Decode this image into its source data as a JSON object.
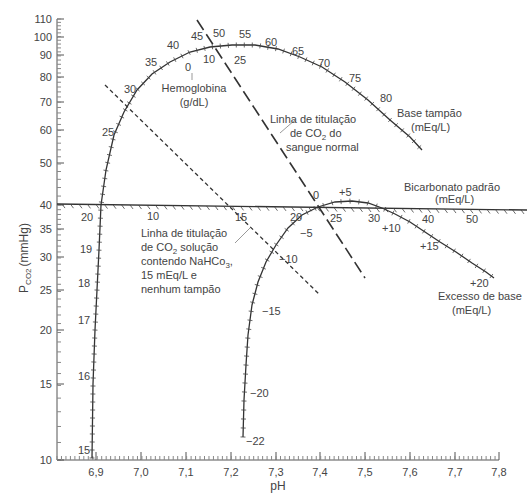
{
  "chart_data": {
    "type": "line",
    "title": "",
    "xlabel": "pH",
    "ylabel": "PCO2 (mmHg)",
    "ylabel_main": "P",
    "ylabel_sub": "CO2",
    "ylabel_unit": "(mmHg)",
    "y_scale": "log",
    "xlim": [
      6.8,
      7.8
    ],
    "ylim": [
      10,
      110
    ],
    "x_ticks": [
      "6,9",
      "7,0",
      "7,1",
      "7,2",
      "7,3",
      "7,4",
      "7,5",
      "7,6",
      "7,7",
      "7,8"
    ],
    "y_ticks": [
      "10",
      "15",
      "20",
      "25",
      "30",
      "35",
      "40",
      "50",
      "60",
      "70",
      "80",
      "90",
      "100",
      "110"
    ],
    "series": [
      {
        "name": "Base tampão (mEq/L)",
        "style": "solid-hatched",
        "tick_labels": [
          "15",
          "16",
          "17",
          "18",
          "19",
          "20",
          "25",
          "30",
          "35",
          "40",
          "45",
          "50",
          "55",
          "60",
          "65",
          "70",
          "75",
          "80"
        ],
        "points_ph_pco2": [
          [
            6.89,
            10
          ],
          [
            6.89,
            15.5
          ],
          [
            6.9,
            20.5
          ],
          [
            6.9,
            25.5
          ],
          [
            6.9,
            30.5
          ],
          [
            6.91,
            36
          ],
          [
            6.92,
            47
          ],
          [
            6.97,
            62
          ],
          [
            7.0,
            72
          ],
          [
            7.06,
            82
          ],
          [
            7.12,
            89
          ],
          [
            7.18,
            91
          ],
          [
            7.26,
            90
          ],
          [
            7.36,
            85
          ],
          [
            7.46,
            77
          ],
          [
            7.52,
            72
          ],
          [
            7.58,
            66
          ]
        ]
      },
      {
        "name": "Excesso de base (mEq/L)",
        "style": "solid-hatched",
        "tick_labels": [
          "-22",
          "-20",
          "-15",
          "-10",
          "-5",
          "0",
          "+5",
          "+10",
          "+15",
          "+20"
        ],
        "points_ph_pco2": [
          [
            7.24,
            11.5
          ],
          [
            7.24,
            15
          ],
          [
            7.25,
            19
          ],
          [
            7.28,
            25
          ],
          [
            7.32,
            31
          ],
          [
            7.38,
            37.5
          ],
          [
            7.44,
            40
          ],
          [
            7.49,
            40
          ],
          [
            7.55,
            36
          ],
          [
            7.66,
            32
          ],
          [
            7.78,
            26.5
          ]
        ]
      },
      {
        "name": "Bicarbonato padrão (mEq/L)",
        "style": "solid-hatched",
        "tick_labels": [
          "20",
          "10",
          "15",
          "20",
          "25",
          "30",
          "40",
          "50"
        ],
        "points_ph_pco2": [
          [
            6.8,
            40
          ],
          [
            7.8,
            39
          ]
        ]
      },
      {
        "name": "Linha de titulação de CO2 do sangue normal",
        "style": "long-dash",
        "points_ph_pco2": [
          [
            7.12,
            110
          ],
          [
            7.49,
            28.5
          ]
        ]
      },
      {
        "name": "Linha de titulação de CO2 solução contendo NaHCO3, 15 mEq/L e nenhum tampão",
        "style": "short-dash",
        "points_ph_pco2": [
          [
            6.91,
            76
          ],
          [
            7.39,
            28
          ]
        ]
      }
    ],
    "annotations": [
      "Hemoglobina (g/dL)",
      "0",
      "10",
      "25",
      "Base tampão (mEq/L)",
      "Linha de titulação de CO2 do sangue normal",
      "Bicarbonato padrão (mEq/L)",
      "Linha de titulação de CO2 solução contendo NaHCo3, 15 mEq/L e nenhum tampão",
      "Excesso de base (mEq/L)"
    ],
    "grid": false,
    "legend": "none (inline annotations)"
  },
  "labels": {
    "x_axis": "pH",
    "y_axis_p": "P",
    "y_axis_sub": "CO2",
    "y_axis_unit": "(mmHg)",
    "hemoglobin_title": "Hemoglobina",
    "hemoglobin_unit": "(g/dL)",
    "hb_values": [
      "0",
      "10",
      "25"
    ],
    "base_buffer_title": "Base tampão",
    "base_buffer_unit": "(mEq/L)",
    "blood_line_1": "Linha de titulação",
    "blood_line_2a": "de CO",
    "blood_line_2sub": "2",
    "blood_line_2b": " do",
    "blood_line_3": "sangue normal",
    "bicarb_title": "Bicarbonato padrão",
    "bicarb_unit": "(mEq/L)",
    "sol_line_1": "Linha de titulação",
    "sol_line_2a": "de CO",
    "sol_line_2sub": "2",
    "sol_line_2b": " solução",
    "sol_line_3a": "contendo NaHCo",
    "sol_line_3sub": "3",
    "sol_line_3b": ",",
    "sol_line_4": "15 mEq/L e",
    "sol_line_5": "nenhum tampão",
    "base_excess_title": "Excesso de base",
    "base_excess_unit": "(mEq/L)",
    "bb_ticks": {
      "t15": "15",
      "t16": "16",
      "t17": "17",
      "t18": "18",
      "t19": "19",
      "t20": "20",
      "t25": "25",
      "t30": "30",
      "t35": "35",
      "t40": "40",
      "t45": "45",
      "t50": "50",
      "t55": "55",
      "t60": "60",
      "t65": "65",
      "t70": "70",
      "t75": "75",
      "t80": "80"
    },
    "be_ticks": {
      "m22": "−22",
      "m20": "−20",
      "m15": "−15",
      "m10": "−10",
      "m5": "−5",
      "z0": "0",
      "p5": "+5",
      "p10": "+10",
      "p15": "+15",
      "p20": "+20"
    },
    "sb_ticks": {
      "s10": "10",
      "s15": "15",
      "s20": "20",
      "s25": "25",
      "s30": "30",
      "s40": "40",
      "s50": "50"
    }
  },
  "axis": {
    "y": [
      {
        "label": "110",
        "y": 19
      },
      {
        "label": "100",
        "y": 37
      },
      {
        "label": "90",
        "y": 55
      },
      {
        "label": "80",
        "y": 77
      },
      {
        "label": "70",
        "y": 102
      },
      {
        "label": "60",
        "y": 130
      },
      {
        "label": "50",
        "y": 163
      },
      {
        "label": "40",
        "y": 205
      },
      {
        "label": "35",
        "y": 229
      },
      {
        "label": "30",
        "y": 257
      },
      {
        "label": "25",
        "y": 290
      },
      {
        "label": "20",
        "y": 330
      },
      {
        "label": "15",
        "y": 384
      },
      {
        "label": "10",
        "y": 460
      }
    ],
    "x": [
      {
        "label": "6,9",
        "x": 96
      },
      {
        "label": "7,0",
        "x": 141
      },
      {
        "label": "7,1",
        "x": 186
      },
      {
        "label": "7,2",
        "x": 231
      },
      {
        "label": "7,3",
        "x": 276
      },
      {
        "label": "7,4",
        "x": 320
      },
      {
        "label": "7,5",
        "x": 365
      },
      {
        "label": "7,6",
        "x": 410
      },
      {
        "label": "7,7",
        "x": 455
      },
      {
        "label": "7,8",
        "x": 499
      }
    ]
  }
}
